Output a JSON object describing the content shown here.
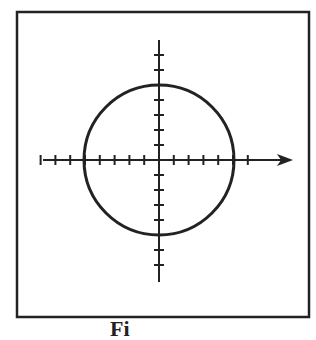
{
  "figure": {
    "frame": {
      "x": 17,
      "y": 12,
      "width": 292,
      "height": 305
    },
    "colors": {
      "stroke": "#222222",
      "background": "#ffffff"
    },
    "x_axis": {
      "y": 160,
      "x_start": 43,
      "x_end": 293,
      "arrow": true,
      "tick_spacing": 14.8,
      "ticks_left": 8,
      "ticks_right": 6
    },
    "y_axis": {
      "x": 159,
      "y_start": 40,
      "y_end": 282,
      "arrow": false,
      "tick_spacing": 15,
      "ticks_up": 8,
      "ticks_down": 8
    },
    "circle": {
      "cx": 159,
      "cy": 160,
      "r": 75
    },
    "caption": "Fi"
  }
}
